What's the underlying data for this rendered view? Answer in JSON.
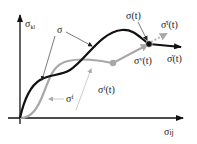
{
  "diagram": {
    "type": "stress-space schematic",
    "axes": {
      "y_label": {
        "base": "σ",
        "sub": "kl"
      },
      "x_label": {
        "base": "σ",
        "sub": "ij"
      }
    },
    "curves": [
      {
        "name": "sigma-total",
        "label": "σ",
        "color": "#111111"
      },
      {
        "name": "sigma-f",
        "label_base": "σ",
        "label_sup": "f",
        "color": "#a8a8a8"
      }
    ],
    "points": {
      "sigma_t": {
        "label": "σ(t)"
      },
      "sigma_f_t": {
        "label_base": "σ",
        "label_sup": "f",
        "label_tail": "(t)"
      },
      "sigma_v_t": {
        "label_base": "σ",
        "label_sup": "v",
        "label_tail": "(t)"
      }
    },
    "rates": {
      "sigma_dot": {
        "label": "σ̇(t)"
      },
      "sigma_f_dot": {
        "label_base": "σ̇",
        "label_sup": "f",
        "label_tail": "(t)"
      }
    },
    "colors": {
      "black_curve": "#111111",
      "gray_curve": "#a8a8a8",
      "gray_dashed": "#b5b5b5",
      "axis": "#111111"
    }
  }
}
